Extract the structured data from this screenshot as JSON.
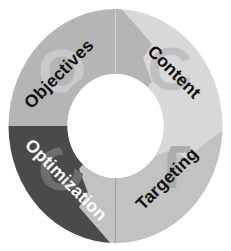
{
  "diagram": {
    "type": "cyclical-donut-4-step",
    "background_color": "#ffffff",
    "center_hole_color": "#ffffff",
    "segments": [
      {
        "id": "objectives",
        "label": "Objectives",
        "watermark": "O",
        "position": "top-left",
        "fill": "#b5b5b5",
        "watermark_fill": "#c9c9c9",
        "text_color": "#111111",
        "label_rotation": -45
      },
      {
        "id": "content",
        "label": "Content",
        "watermark": "C",
        "position": "top-right",
        "fill": "#d8d8d8",
        "watermark_fill": "#bfbfbf",
        "text_color": "#111111",
        "label_rotation": 45
      },
      {
        "id": "targeting",
        "label": "Targeting",
        "watermark": "T",
        "position": "bottom-right",
        "fill": "#c2c2c2",
        "watermark_fill": "#adadad",
        "text_color": "#111111",
        "label_rotation": -45
      },
      {
        "id": "optimization",
        "label": "Optimization",
        "watermark": "O",
        "position": "bottom-left",
        "fill": "#4a4a4a",
        "watermark_fill": "#6e6e6e",
        "text_color": "#ffffff",
        "label_rotation": 45
      }
    ],
    "arrows": [
      {
        "id": "arrow-top",
        "from": "objectives",
        "to": "content",
        "fill": "#b5b5b5",
        "direction": "clockwise"
      },
      {
        "id": "arrow-right",
        "from": "content",
        "to": "targeting",
        "fill": "#d8d8d8",
        "direction": "clockwise"
      },
      {
        "id": "arrow-bottom",
        "from": "targeting",
        "to": "optimization",
        "fill": "#c2c2c2",
        "direction": "clockwise"
      },
      {
        "id": "arrow-left",
        "from": "optimization",
        "to": "objectives",
        "fill": "#4a4a4a",
        "direction": "clockwise"
      }
    ]
  }
}
